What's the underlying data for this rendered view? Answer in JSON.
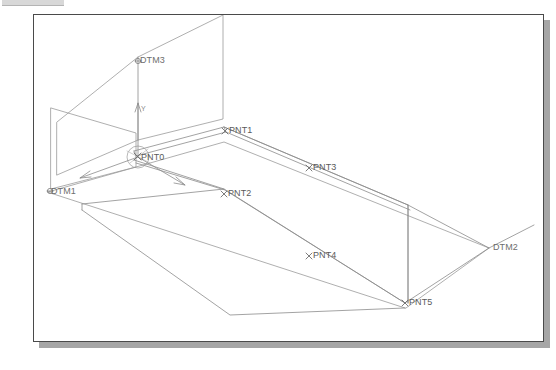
{
  "window": {
    "title": "CAD Graphics Window",
    "background_color": "#ffffff",
    "border_color": "#4a4a4a",
    "shadow_color": "#a6a6a6",
    "strip_color": "#d8d8d8"
  },
  "viewport": {
    "width": 511,
    "height": 328,
    "geometry_line_color": "#8c8c8c",
    "label_color": "#6e6e6e"
  },
  "model": {
    "datum_planes": [
      {
        "id": "DTM3",
        "label": "DTM3",
        "orientation": "vertical-back"
      },
      {
        "id": "DTM1",
        "label": "DTM1",
        "orientation": "vertical-left"
      },
      {
        "id": "DTM2",
        "label": "DTM2",
        "orientation": "horizontal-base"
      }
    ],
    "datum_points": [
      {
        "id": "PNT0",
        "label": "PNT0",
        "marker": "x",
        "role": "origin"
      },
      {
        "id": "PNT1",
        "label": "PNT1",
        "marker": "x"
      },
      {
        "id": "PNT2",
        "label": "PNT2",
        "marker": "x"
      },
      {
        "id": "PNT3",
        "label": "PNT3",
        "marker": "x"
      },
      {
        "id": "PNT4",
        "label": "PNT4",
        "marker": "x"
      },
      {
        "id": "PNT5",
        "label": "PNT5",
        "marker": "x"
      }
    ],
    "coordinate_system": {
      "label": "",
      "axes": [
        {
          "name": "Y",
          "label": "Y",
          "direction": "up"
        },
        {
          "name": "X",
          "label": "X",
          "direction": "lower-left"
        },
        {
          "name": "Z",
          "label": "Z",
          "direction": "lower-right"
        }
      ]
    }
  },
  "labels": {
    "dtm3": "DTM3",
    "dtm1": "DTM1",
    "dtm2": "DTM2",
    "pnt0": "PNT0",
    "pnt1": "PNT1",
    "pnt2": "PNT2",
    "pnt3": "PNT3",
    "pnt4": "PNT4",
    "pnt5": "PNT5",
    "axis_y": "Y"
  }
}
